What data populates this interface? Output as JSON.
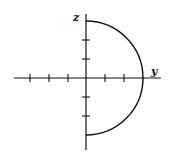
{
  "diagram": {
    "axes": {
      "horizontal_label": "y",
      "vertical_label": "z"
    },
    "curve": "semicircle in right half-plane (y ≥ 0), radius 3 units",
    "ticks": {
      "horizontal_negative": 3,
      "horizontal_positive": 2,
      "vertical_positive": 2,
      "vertical_negative": 2
    },
    "colors": {
      "stroke": "#111111",
      "background": "#ffffff"
    }
  }
}
